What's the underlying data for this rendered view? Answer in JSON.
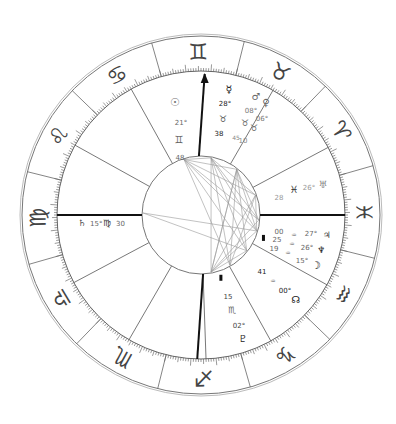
{
  "chart": {
    "ascendant": {
      "sign": "Virgo",
      "degree": 15,
      "minute": 30,
      "label_deg": "15°",
      "label_min": "30",
      "sign_symbol": "♍",
      "planet_symbol": "♄"
    },
    "zodiac_signs": [
      {
        "name": "Aries",
        "symbol": "♈"
      },
      {
        "name": "Taurus",
        "symbol": "♉"
      },
      {
        "name": "Gemini",
        "symbol": "♊"
      },
      {
        "name": "Cancer",
        "symbol": "♋"
      },
      {
        "name": "Leo",
        "symbol": "♌"
      },
      {
        "name": "Virgo",
        "symbol": "♍"
      },
      {
        "name": "Libra",
        "symbol": "♎"
      },
      {
        "name": "Scorpio",
        "symbol": "♏"
      },
      {
        "name": "Sagittarius",
        "symbol": "♐"
      },
      {
        "name": "Capricorn",
        "symbol": "♑"
      },
      {
        "name": "Aquarius",
        "symbol": "♒"
      },
      {
        "name": "Pisces",
        "symbol": "♓"
      }
    ],
    "planet_groups": [
      {
        "name": "gemini-group",
        "items": [
          {
            "text": "☉",
            "kind": "glyph",
            "name": "sun-icon"
          },
          {
            "text": "21°",
            "kind": "deg",
            "name": "sun-degree"
          },
          {
            "text": "♊",
            "kind": "sign",
            "name": "sun-sign"
          },
          {
            "text": "48",
            "kind": "min",
            "name": "sun-minute"
          }
        ]
      },
      {
        "name": "taurus-group",
        "items": [
          {
            "text": "☿",
            "kind": "glyph",
            "name": "mercury-icon"
          },
          {
            "text": "28°",
            "kind": "deg",
            "name": "mercury-degree"
          },
          {
            "text": "♉",
            "kind": "sign",
            "name": "mercury-sign"
          },
          {
            "text": "38",
            "kind": "min",
            "name": "mercury-minute"
          },
          {
            "text": "♂",
            "kind": "glyph",
            "name": "mars-icon"
          },
          {
            "text": "♀",
            "kind": "glyph",
            "name": "venus-icon"
          },
          {
            "text": "08°",
            "kind": "deg",
            "name": "mars-degree"
          },
          {
            "text": "06°",
            "kind": "deg",
            "name": "venus-degree"
          },
          {
            "text": "♉",
            "kind": "sign",
            "name": "mars-sign"
          },
          {
            "text": "♉",
            "kind": "sign",
            "name": "venus-sign"
          },
          {
            "text": "45",
            "kind": "min",
            "name": "mars-minute"
          },
          {
            "text": "10",
            "kind": "min",
            "name": "venus-minute"
          }
        ]
      },
      {
        "name": "pisces-group",
        "items": [
          {
            "text": "28",
            "kind": "min",
            "name": "uranus-minute"
          },
          {
            "text": "♓",
            "kind": "sign",
            "name": "uranus-sign"
          },
          {
            "text": "26°",
            "kind": "deg",
            "name": "uranus-degree"
          },
          {
            "text": "♅",
            "kind": "glyph",
            "name": "uranus-icon"
          }
        ]
      },
      {
        "name": "aquarius-group",
        "items": [
          {
            "text": "00",
            "kind": "min",
            "name": "jupiter-minute"
          },
          {
            "text": "♒",
            "kind": "sign",
            "name": "jupiter-sign"
          },
          {
            "text": "27°",
            "kind": "deg",
            "name": "jupiter-degree"
          },
          {
            "text": "♃",
            "kind": "glyph",
            "name": "jupiter-icon"
          },
          {
            "text": "25",
            "kind": "min",
            "name": "neptune-minute"
          },
          {
            "text": "♒",
            "kind": "sign",
            "name": "neptune-sign"
          },
          {
            "text": "26°",
            "kind": "deg",
            "name": "neptune-degree"
          },
          {
            "text": "♆",
            "kind": "glyph",
            "name": "neptune-icon"
          },
          {
            "text": "19",
            "kind": "min",
            "name": "moon-minute"
          },
          {
            "text": "♒",
            "kind": "sign",
            "name": "moon-sign"
          },
          {
            "text": "15°",
            "kind": "deg",
            "name": "moon-degree"
          },
          {
            "text": "☽",
            "kind": "glyph",
            "name": "moon-icon"
          }
        ]
      },
      {
        "name": "node-group",
        "items": [
          {
            "text": "41",
            "kind": "min",
            "name": "node-minute"
          },
          {
            "text": "♒",
            "kind": "sign",
            "name": "node-sign"
          },
          {
            "text": "00°",
            "kind": "deg",
            "name": "node-degree"
          },
          {
            "text": "☊",
            "kind": "glyph",
            "name": "north-node-icon"
          }
        ]
      },
      {
        "name": "capricorn-group",
        "items": [
          {
            "text": "15",
            "kind": "min",
            "name": "pluto-minute"
          },
          {
            "text": "♏",
            "kind": "sign",
            "name": "pluto-sign"
          },
          {
            "text": "02°",
            "kind": "deg",
            "name": "pluto-degree"
          },
          {
            "text": "♇",
            "kind": "glyph",
            "name": "pluto-icon"
          }
        ]
      }
    ],
    "colors": {
      "line": "#333333",
      "light_line": "#888888",
      "aspect": "#999999",
      "text": "#444444"
    }
  }
}
